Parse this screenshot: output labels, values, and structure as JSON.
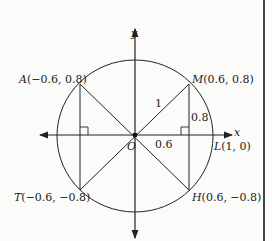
{
  "diagram": {
    "axes": {
      "x_label": "x",
      "y_label": "y",
      "origin_label": "O"
    },
    "points": [
      {
        "name": "A",
        "coords": "(−0.6, 0.8)"
      },
      {
        "name": "M",
        "coords": "(0.6, 0.8)"
      },
      {
        "name": "T",
        "coords": "(−0.6, −0.8)"
      },
      {
        "name": "H",
        "coords": "(0.6, −0.8)"
      },
      {
        "name": "L",
        "coords": "(1, 0)"
      }
    ],
    "labels": {
      "radius": "1",
      "height": "0.8",
      "base": "0.6"
    },
    "colors": {
      "line": "#222222",
      "background": "#fbfbfa",
      "border": "#444444"
    }
  }
}
